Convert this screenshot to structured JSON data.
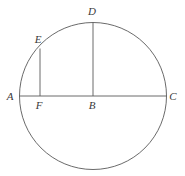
{
  "figure": {
    "type": "geometry-diagram",
    "background_color": "#ffffff",
    "stroke_color": "#595959",
    "label_color": "#3a3a3a",
    "stroke_width": 0.9,
    "canvas": {
      "width": 185,
      "height": 176
    },
    "circle": {
      "cx": 93,
      "cy": 96,
      "r": 73.5
    },
    "points": [
      {
        "id": "A",
        "label": "A",
        "x": 19.5,
        "y": 96,
        "label_x": 10,
        "label_y": 96
      },
      {
        "id": "F",
        "label": "F",
        "x": 40,
        "y": 96,
        "label_x": 39,
        "label_y": 105
      },
      {
        "id": "B",
        "label": "B",
        "x": 93,
        "y": 96,
        "label_x": 92,
        "label_y": 105
      },
      {
        "id": "C",
        "label": "C",
        "x": 166.5,
        "y": 96,
        "label_x": 173,
        "label_y": 96
      },
      {
        "id": "D",
        "label": "D",
        "x": 93,
        "y": 22.5,
        "label_x": 92,
        "label_y": 11
      },
      {
        "id": "E",
        "label": "E",
        "x": 40,
        "y": 48.5,
        "label_x": 38,
        "label_y": 39
      }
    ],
    "segments": [
      {
        "id": "AC",
        "name": "diameter-ac",
        "x1": 19.5,
        "y1": 96,
        "x2": 166.5,
        "y2": 96
      },
      {
        "id": "DB",
        "name": "chord-db",
        "x1": 93,
        "y1": 22.5,
        "x2": 93,
        "y2": 96
      },
      {
        "id": "EF",
        "name": "chord-ef",
        "x1": 40,
        "y1": 48.5,
        "x2": 40,
        "y2": 96
      }
    ]
  }
}
